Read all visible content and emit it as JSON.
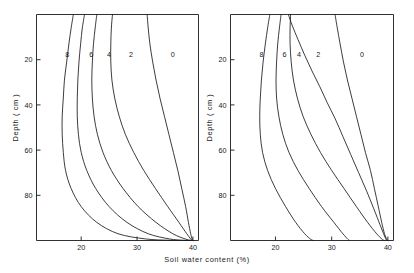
{
  "chart_data": {
    "type": "line",
    "title": "",
    "xlabel": "Soil water content (%)",
    "ylabel": "Depth ( cm )",
    "xlim": [
      12,
      41
    ],
    "ylim": [
      0,
      100
    ],
    "y_inverted": true,
    "grid": false,
    "legend": "inline curve labels at top of each curve",
    "xticks": [
      20,
      30,
      40
    ],
    "xticklabels": [
      "20",
      "30",
      "40"
    ],
    "yticks": [
      20,
      40,
      60,
      80
    ],
    "yticklabels": [
      "20",
      "40",
      "60",
      "80"
    ],
    "panels": [
      {
        "name": "left-panel",
        "label": "",
        "series": [
          {
            "name": "8",
            "label": "8",
            "label_x": 17.5,
            "label_y": 19,
            "points": [
              [
                18.6,
                0
              ],
              [
                18.2,
                6
              ],
              [
                17.8,
                13
              ],
              [
                17.4,
                21
              ],
              [
                17.0,
                29
              ],
              [
                16.8,
                37
              ],
              [
                16.6,
                45
              ],
              [
                16.6,
                53
              ],
              [
                16.8,
                61
              ],
              [
                17.2,
                69
              ],
              [
                18.2,
                77
              ],
              [
                20.0,
                85
              ],
              [
                22.8,
                92
              ],
              [
                26.6,
                97
              ],
              [
                31.5,
                99.3
              ],
              [
                36.0,
                99.9
              ],
              [
                40,
                100
              ]
            ]
          },
          {
            "name": "6",
            "label": "6",
            "label_x": 21.8,
            "label_y": 19,
            "points": [
              [
                20.6,
                0
              ],
              [
                20.2,
                6
              ],
              [
                19.9,
                13
              ],
              [
                19.6,
                21
              ],
              [
                19.4,
                29
              ],
              [
                19.3,
                37
              ],
              [
                19.3,
                45
              ],
              [
                19.5,
                53
              ],
              [
                20.0,
                61
              ],
              [
                21.0,
                69
              ],
              [
                22.6,
                77
              ],
              [
                25.0,
                85
              ],
              [
                28.2,
                92
              ],
              [
                32.0,
                97
              ],
              [
                35.8,
                99.3
              ],
              [
                38.3,
                99.9
              ],
              [
                40,
                100
              ]
            ]
          },
          {
            "name": "4",
            "label": "4",
            "label_x": 25.0,
            "label_y": 19,
            "points": [
              [
                22.8,
                0
              ],
              [
                22.5,
                6
              ],
              [
                22.2,
                13
              ],
              [
                22.0,
                21
              ],
              [
                21.9,
                29
              ],
              [
                22.0,
                37
              ],
              [
                22.3,
                45
              ],
              [
                22.9,
                53
              ],
              [
                23.9,
                61
              ],
              [
                25.4,
                69
              ],
              [
                27.5,
                77
              ],
              [
                30.2,
                85
              ],
              [
                33.4,
                92
              ],
              [
                36.4,
                97
              ],
              [
                38.6,
                99.3
              ],
              [
                39.6,
                99.9
              ],
              [
                40,
                100
              ]
            ]
          },
          {
            "name": "2",
            "label": "2",
            "label_x": 28.9,
            "label_y": 19,
            "points": [
              [
                25.6,
                0
              ],
              [
                25.4,
                6
              ],
              [
                25.3,
                13
              ],
              [
                25.3,
                21
              ],
              [
                25.5,
                29
              ],
              [
                26.0,
                37
              ],
              [
                26.8,
                45
              ],
              [
                27.9,
                53
              ],
              [
                29.4,
                61
              ],
              [
                31.2,
                69
              ],
              [
                33.3,
                77
              ],
              [
                35.5,
                85
              ],
              [
                37.5,
                92
              ],
              [
                38.9,
                97
              ],
              [
                39.6,
                99.3
              ],
              [
                39.9,
                99.9
              ],
              [
                40,
                100
              ]
            ]
          },
          {
            "name": "0",
            "label": "0",
            "label_x": 36.4,
            "label_y": 19,
            "points": [
              [
                31.8,
                0
              ],
              [
                32.0,
                6
              ],
              [
                32.3,
                13
              ],
              [
                32.8,
                21
              ],
              [
                33.4,
                29
              ],
              [
                34.1,
                37
              ],
              [
                34.9,
                45
              ],
              [
                35.7,
                53
              ],
              [
                36.5,
                61
              ],
              [
                37.3,
                69
              ],
              [
                38.0,
                77
              ],
              [
                38.7,
                85
              ],
              [
                39.2,
                92
              ],
              [
                39.6,
                97
              ],
              [
                39.85,
                99.3
              ],
              [
                39.95,
                99.9
              ],
              [
                40,
                100
              ]
            ]
          }
        ]
      },
      {
        "name": "right-panel",
        "label": "",
        "series": [
          {
            "name": "8",
            "label": "8",
            "label_x": 17.5,
            "label_y": 19,
            "points": [
              [
                19.0,
                0
              ],
              [
                18.6,
                6
              ],
              [
                18.2,
                13
              ],
              [
                17.8,
                21
              ],
              [
                17.5,
                29
              ],
              [
                17.3,
                37
              ],
              [
                17.2,
                45
              ],
              [
                17.3,
                53
              ],
              [
                17.7,
                61
              ],
              [
                18.6,
                69
              ],
              [
                20.0,
                77
              ],
              [
                21.8,
                85
              ],
              [
                23.6,
                92
              ],
              [
                25.2,
                97
              ],
              [
                26.3,
                99.5
              ],
              [
                26.8,
                100
              ]
            ]
          },
          {
            "name": "6",
            "label": "6",
            "label_x": 21.6,
            "label_y": 19,
            "points": [
              [
                21.0,
                0
              ],
              [
                20.7,
                6
              ],
              [
                20.4,
                13
              ],
              [
                20.2,
                21
              ],
              [
                20.1,
                29
              ],
              [
                20.2,
                37
              ],
              [
                20.6,
                45
              ],
              [
                21.3,
                53
              ],
              [
                22.4,
                61
              ],
              [
                24.0,
                69
              ],
              [
                26.0,
                77
              ],
              [
                28.2,
                85
              ],
              [
                30.4,
                92
              ],
              [
                32.0,
                97
              ],
              [
                32.9,
                99.5
              ],
              [
                33.2,
                100
              ]
            ]
          },
          {
            "name": "4",
            "label": "4",
            "label_x": 24.2,
            "label_y": 19,
            "points": [
              [
                22.7,
                0
              ],
              [
                22.6,
                6
              ],
              [
                22.6,
                13
              ],
              [
                22.8,
                21
              ],
              [
                23.2,
                29
              ],
              [
                23.9,
                37
              ],
              [
                24.9,
                45
              ],
              [
                26.3,
                53
              ],
              [
                28.0,
                61
              ],
              [
                30.0,
                69
              ],
              [
                32.2,
                77
              ],
              [
                34.4,
                85
              ],
              [
                36.4,
                92
              ],
              [
                38.0,
                97
              ],
              [
                39.0,
                99.5
              ],
              [
                39.4,
                100
              ]
            ]
          },
          {
            "name": "2",
            "label": "2",
            "label_x": 27.6,
            "label_y": 19,
            "points": [
              [
                22.3,
                0
              ],
              [
                23.0,
                5
              ],
              [
                24.0,
                11
              ],
              [
                25.2,
                18
              ],
              [
                26.5,
                25
              ],
              [
                27.9,
                32
              ],
              [
                29.2,
                39
              ],
              [
                30.6,
                46
              ],
              [
                32.0,
                54
              ],
              [
                33.4,
                62
              ],
              [
                34.8,
                70
              ],
              [
                36.2,
                78
              ],
              [
                37.5,
                86
              ],
              [
                38.6,
                93
              ],
              [
                39.4,
                98
              ],
              [
                39.8,
                100
              ]
            ]
          },
          {
            "name": "0",
            "label": "0",
            "label_x": 35.4,
            "label_y": 19,
            "points": [
              [
                30.6,
                0
              ],
              [
                31.0,
                6
              ],
              [
                31.5,
                13
              ],
              [
                32.1,
                21
              ],
              [
                32.8,
                29
              ],
              [
                33.6,
                37
              ],
              [
                34.4,
                45
              ],
              [
                35.2,
                53
              ],
              [
                36.0,
                61
              ],
              [
                36.9,
                69
              ],
              [
                37.6,
                77
              ],
              [
                38.3,
                85
              ],
              [
                38.9,
                92
              ],
              [
                39.4,
                97
              ],
              [
                39.8,
                99.5
              ],
              [
                40,
                100
              ]
            ]
          }
        ]
      }
    ]
  }
}
